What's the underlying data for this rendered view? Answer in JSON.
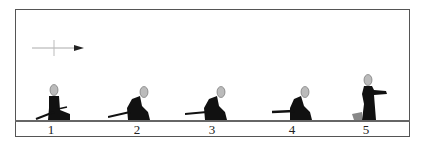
{
  "diagram": {
    "type": "sequence",
    "direction_indicator": "right-arrow",
    "frames": [
      {
        "label": "1",
        "pose": "seated upright"
      },
      {
        "label": "2",
        "pose": "leaning forward"
      },
      {
        "label": "3",
        "pose": "leaning forward"
      },
      {
        "label": "4",
        "pose": "leaning forward, sword drawn back"
      },
      {
        "label": "5",
        "pose": "rising, arm extended"
      }
    ]
  },
  "colors": {
    "figure": "#111111",
    "head": "#bbbbbb",
    "line": "#555555"
  }
}
